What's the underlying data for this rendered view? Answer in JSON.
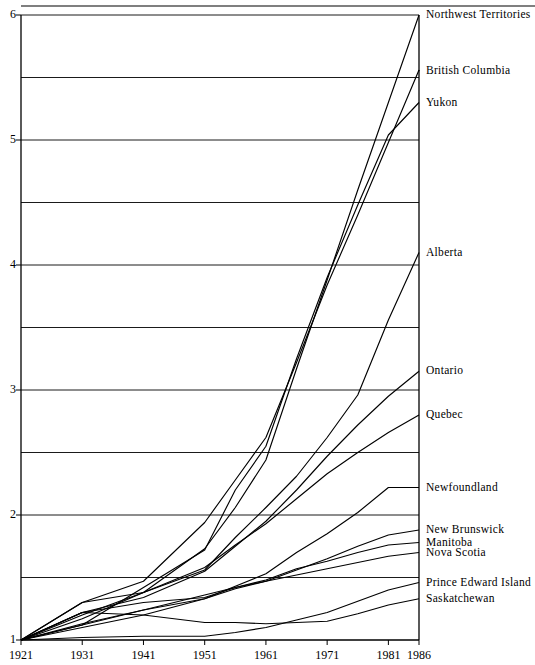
{
  "chart_data": {
    "type": "line",
    "title": "",
    "xlabel": "",
    "ylabel": "",
    "xlim": [
      1921,
      1986
    ],
    "ylim": [
      1,
      6
    ],
    "grid": true,
    "legend_position": "right-inline-labels",
    "x": [
      1921,
      1931,
      1941,
      1951,
      1956,
      1961,
      1966,
      1971,
      1976,
      1981,
      1986
    ],
    "xtick_labels": [
      "1921",
      "1931",
      "1941",
      "1951",
      "1961",
      "1971",
      "1981",
      "1986"
    ],
    "xticks": [
      1921,
      1931,
      1941,
      1951,
      1961,
      1971,
      1981,
      1986
    ],
    "ytick_labels": [
      "1",
      "2",
      "3",
      "4",
      "5",
      "6"
    ],
    "yticks": [
      1,
      2,
      3,
      4,
      5,
      6
    ],
    "gridlines_y": [
      1.5,
      2.0,
      2.5,
      3.0,
      3.5,
      4.0,
      4.5,
      5.0,
      5.5,
      6.0
    ],
    "series": [
      {
        "name": "Northwest Territories",
        "label_y": 6.0,
        "values": [
          1.0,
          1.17,
          1.38,
          1.73,
          2.06,
          2.44,
          3.17,
          3.88,
          4.6,
          5.3,
          6.0
        ]
      },
      {
        "name": "British Columbia",
        "label_y": 5.55,
        "values": [
          1.0,
          1.3,
          1.47,
          1.94,
          2.28,
          2.62,
          3.22,
          3.84,
          4.4,
          4.98,
          5.56
        ]
      },
      {
        "name": "Yukon",
        "label_y": 5.3,
        "values": [
          1.0,
          1.12,
          1.42,
          1.72,
          2.2,
          2.55,
          3.25,
          3.9,
          4.48,
          5.04,
          5.3
        ]
      },
      {
        "name": "Alberta",
        "label_y": 4.1,
        "values": [
          1.0,
          1.3,
          1.38,
          1.56,
          1.82,
          2.06,
          2.31,
          2.62,
          2.96,
          3.56,
          4.1
        ]
      },
      {
        "name": "Ontario",
        "label_y": 3.15,
        "values": [
          1.0,
          1.22,
          1.34,
          1.55,
          1.75,
          1.95,
          2.2,
          2.47,
          2.72,
          2.95,
          3.15
        ]
      },
      {
        "name": "Quebec",
        "label_y": 2.8,
        "values": [
          1.0,
          1.2,
          1.38,
          1.58,
          1.76,
          1.93,
          2.13,
          2.33,
          2.5,
          2.66,
          2.8
        ]
      },
      {
        "name": "Newfoundland",
        "label_y": 2.22,
        "values": [
          1.0,
          1.1,
          1.2,
          1.33,
          1.43,
          1.53,
          1.7,
          1.85,
          2.02,
          2.22,
          2.22
        ]
      },
      {
        "name": "New Brunswick",
        "label_y": 1.88,
        "values": [
          1.0,
          1.13,
          1.24,
          1.33,
          1.41,
          1.47,
          1.56,
          1.65,
          1.75,
          1.84,
          1.88
        ]
      },
      {
        "name": "Manitoba",
        "label_y": 1.78,
        "values": [
          1.0,
          1.22,
          1.3,
          1.34,
          1.42,
          1.48,
          1.57,
          1.63,
          1.7,
          1.76,
          1.78
        ]
      },
      {
        "name": "Nova Scotia",
        "label_y": 1.7,
        "values": [
          1.0,
          1.12,
          1.24,
          1.36,
          1.42,
          1.47,
          1.52,
          1.57,
          1.62,
          1.67,
          1.7
        ]
      },
      {
        "name": "Prince Edward Island",
        "label_y": 1.46,
        "values": [
          1.0,
          1.02,
          1.03,
          1.03,
          1.06,
          1.1,
          1.16,
          1.22,
          1.31,
          1.4,
          1.46
        ]
      },
      {
        "name": "Saskatchewan",
        "label_y": 1.33,
        "values": [
          1.0,
          1.22,
          1.2,
          1.14,
          1.14,
          1.13,
          1.14,
          1.15,
          1.21,
          1.28,
          1.33
        ]
      }
    ]
  },
  "axis": {
    "y_labels": [
      "6",
      "5",
      "4",
      "3",
      "2",
      "1"
    ],
    "x_labels": [
      "1921",
      "1931",
      "1941",
      "1951",
      "1961",
      "1971",
      "1981",
      "1986"
    ]
  },
  "series_labels": [
    "Northwest Territories",
    "British Columbia",
    "Yukon",
    "Alberta",
    "Ontario",
    "Quebec",
    "Newfoundland",
    "New Brunswick",
    "Manitoba",
    "Nova Scotia",
    "Prince Edward Island",
    "Saskatchewan"
  ]
}
